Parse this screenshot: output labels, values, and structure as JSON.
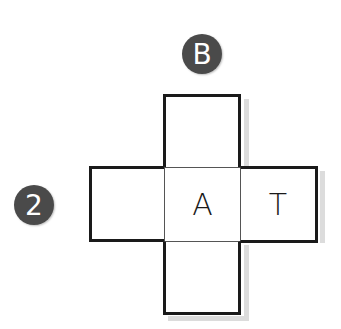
{
  "diagram": {
    "type": "cube-net",
    "cells": [
      {
        "id": "top",
        "label": ""
      },
      {
        "id": "left",
        "label": ""
      },
      {
        "id": "center",
        "label": "A"
      },
      {
        "id": "right",
        "label": "T"
      },
      {
        "id": "bottom",
        "label": ""
      }
    ],
    "badges": [
      {
        "id": "badge-b",
        "label": "B",
        "position": "above top cell"
      },
      {
        "id": "badge-2",
        "label": "2",
        "position": "left of left cell"
      }
    ],
    "colors": {
      "outline": "#1a1a1a",
      "inner_line": "#555555",
      "badge_fill": "#4a4a4a",
      "badge_text": "#ffffff"
    }
  }
}
